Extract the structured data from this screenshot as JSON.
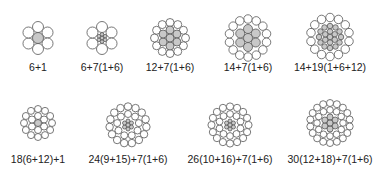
{
  "colors": {
    "outer": "#ffffff",
    "core": "#c8c8c8",
    "stroke": "#555555"
  },
  "strands": [
    {
      "label": "6+1",
      "cx": 38,
      "cy": 38,
      "label_y": 67,
      "layers": [
        {
          "n": 1,
          "r": 0,
          "d": 11,
          "fill": "core"
        },
        {
          "n": 6,
          "r": 11,
          "d": 11,
          "fill": "outer"
        }
      ]
    },
    {
      "label": "6+7(1+6)",
      "cx": 102,
      "cy": 38,
      "label_y": 67,
      "layers": [
        {
          "n": 1,
          "r": 0,
          "d": 3.6,
          "fill": "core"
        },
        {
          "n": 6,
          "r": 3.6,
          "d": 3.6,
          "fill": "core"
        },
        {
          "n": 6,
          "r": 11,
          "d": 11,
          "fill": "outer"
        }
      ]
    },
    {
      "label": "12+7(1+6)",
      "cx": 170,
      "cy": 38,
      "label_y": 67,
      "layers": [
        {
          "n": 1,
          "r": 0,
          "d": 8,
          "fill": "core"
        },
        {
          "n": 6,
          "r": 8,
          "d": 8,
          "fill": "core"
        },
        {
          "n": 12,
          "r": 15.5,
          "d": 8,
          "fill": "outer"
        }
      ]
    },
    {
      "label": "14+7(1+6)",
      "cx": 248,
      "cy": 38,
      "label_y": 67,
      "layers": [
        {
          "n": 1,
          "r": 0,
          "d": 9,
          "fill": "core"
        },
        {
          "n": 6,
          "r": 9,
          "d": 9,
          "fill": "core"
        },
        {
          "n": 14,
          "r": 19,
          "d": 8.5,
          "fill": "outer"
        }
      ]
    },
    {
      "label": "14+19(1+6+12)",
      "cx": 330,
      "cy": 37,
      "label_y": 67,
      "layers": [
        {
          "n": 1,
          "r": 0,
          "d": 5.5,
          "fill": "core"
        },
        {
          "n": 6,
          "r": 5.5,
          "d": 5.5,
          "fill": "core"
        },
        {
          "n": 12,
          "r": 11,
          "d": 5.5,
          "fill": "core"
        },
        {
          "n": 14,
          "r": 19.5,
          "d": 8.5,
          "fill": "outer"
        }
      ]
    },
    {
      "label": "18(6+12)+1",
      "cx": 38,
      "cy": 123,
      "label_y": 159,
      "layers": [
        {
          "n": 1,
          "r": 0,
          "d": 7,
          "fill": "core"
        },
        {
          "n": 6,
          "r": 7,
          "d": 7,
          "fill": "outer"
        },
        {
          "n": 12,
          "r": 14,
          "d": 7,
          "fill": "outer"
        }
      ]
    },
    {
      "label": "24(9+15)+7(1+6)",
      "cx": 128,
      "cy": 125,
      "label_y": 159,
      "layers": [
        {
          "n": 1,
          "r": 0,
          "d": 4,
          "fill": "core"
        },
        {
          "n": 6,
          "r": 4,
          "d": 4,
          "fill": "core"
        },
        {
          "n": 9,
          "r": 11,
          "d": 7,
          "fill": "outer"
        },
        {
          "n": 15,
          "r": 18.5,
          "d": 7.5,
          "fill": "outer"
        }
      ]
    },
    {
      "label": "26(10+16)+7(1+6)",
      "cx": 230,
      "cy": 125,
      "label_y": 159,
      "layers": [
        {
          "n": 1,
          "r": 0,
          "d": 4,
          "fill": "core"
        },
        {
          "n": 6,
          "r": 4,
          "d": 4,
          "fill": "core"
        },
        {
          "n": 10,
          "r": 11,
          "d": 6.8,
          "fill": "outer"
        },
        {
          "n": 16,
          "r": 18.5,
          "d": 7.2,
          "fill": "outer"
        }
      ]
    },
    {
      "label": "30(12+18)+7(1+6)",
      "cx": 330,
      "cy": 123,
      "label_y": 159,
      "layers": [
        {
          "n": 1,
          "r": 0,
          "d": 6,
          "fill": "core"
        },
        {
          "n": 6,
          "r": 6,
          "d": 6,
          "fill": "core"
        },
        {
          "n": 12,
          "r": 13,
          "d": 6.6,
          "fill": "outer"
        },
        {
          "n": 18,
          "r": 20,
          "d": 7,
          "fill": "outer"
        }
      ]
    }
  ]
}
